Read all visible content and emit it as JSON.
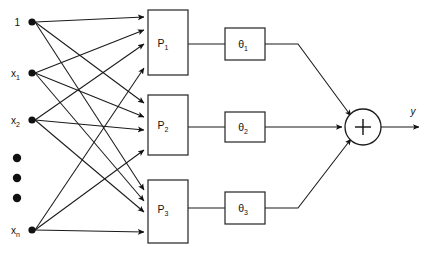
{
  "diagram": {
    "type": "block-diagram",
    "colors": {
      "line": "#1a1a1a",
      "box_stroke": "#2b2b2b",
      "box_fill": "#ffffff",
      "node": "#111111",
      "background": "#ffffff"
    },
    "inputs": [
      {
        "id": "bias",
        "label": "1",
        "sub": "",
        "x": 32,
        "y": 22
      },
      {
        "id": "x1",
        "label": "x",
        "sub": "1",
        "x": 32,
        "y": 73
      },
      {
        "id": "x2",
        "label": "x",
        "sub": "2",
        "x": 32,
        "y": 120
      },
      {
        "id": "xn",
        "label": "x",
        "sub": "n",
        "x": 32,
        "y": 230
      }
    ],
    "ellipsis": {
      "label": "vertical-ellipsis",
      "count": 3,
      "x": 17,
      "ys": [
        158,
        178,
        198
      ]
    },
    "perceptrons": [
      {
        "id": "p1",
        "label": "P",
        "sub": "1",
        "x": 148,
        "y": 10,
        "w": 40,
        "h": 65
      },
      {
        "id": "p2",
        "label": "P",
        "sub": "2",
        "x": 148,
        "y": 95,
        "w": 40,
        "h": 60
      },
      {
        "id": "p3",
        "label": "P",
        "sub": "3",
        "x": 148,
        "y": 180,
        "w": 40,
        "h": 63
      }
    ],
    "weights": [
      {
        "id": "t1",
        "label": "θ",
        "sub": "1",
        "x": 225,
        "y": 28,
        "w": 40,
        "h": 32
      },
      {
        "id": "t2",
        "label": "θ",
        "sub": "2",
        "x": 225,
        "y": 112,
        "w": 40,
        "h": 30
      },
      {
        "id": "t3",
        "label": "θ",
        "sub": "3",
        "x": 225,
        "y": 192,
        "w": 40,
        "h": 32
      }
    ],
    "summation": {
      "id": "sum",
      "label": "+",
      "cx": 363,
      "cy": 127,
      "r": 18
    },
    "output": {
      "id": "y",
      "label": "y",
      "x": 415,
      "y": 110
    }
  }
}
